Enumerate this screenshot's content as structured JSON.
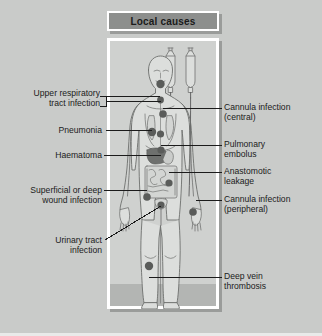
{
  "panel": {
    "title": "Local causes",
    "colors": {
      "page_background": "#c9cbc9",
      "panel_background": "#cfd1cf",
      "panel_border": "#ffffff",
      "titlebar_background": "#8d8f8d",
      "floor_band": "#b3b5b3",
      "marker_dot": "#5a5c5a",
      "haematoma_blob": "#4a4c4a",
      "leader_line": "#1b1b1b",
      "body_outline": "#6d6f6d",
      "text": "#1b1b1b"
    }
  },
  "illustration": {
    "subject": "human-body-outline",
    "elements": [
      {
        "name": "iv-bag-left",
        "label": "intravenous fluid bag"
      },
      {
        "name": "iv-bag-right",
        "label": "intravenous fluid bag"
      },
      {
        "name": "iv-tubing",
        "label": "intravenous tubing"
      },
      {
        "name": "head",
        "label": "head"
      },
      {
        "name": "torso",
        "label": "torso"
      },
      {
        "name": "lungs",
        "label": "lungs"
      },
      {
        "name": "liver",
        "label": "liver"
      },
      {
        "name": "intestines",
        "label": "intestines"
      },
      {
        "name": "bladder",
        "label": "bladder"
      },
      {
        "name": "legs",
        "label": "legs"
      },
      {
        "name": "arms",
        "label": "arms"
      }
    ]
  },
  "labels": {
    "left": [
      {
        "id": "upper-respiratory-tract-infection",
        "text": "Upper respiratory\ntract infection"
      },
      {
        "id": "pneumonia",
        "text": "Pneumonia"
      },
      {
        "id": "haematoma",
        "text": "Haematoma"
      },
      {
        "id": "superficial-or-deep-wound-infection",
        "text": "Superficial or deep\nwound infection"
      },
      {
        "id": "urinary-tract-infection",
        "text": "Urinary tract\ninfection"
      }
    ],
    "right": [
      {
        "id": "cannula-infection-central",
        "text": "Cannula infection\n(central)"
      },
      {
        "id": "pulmonary-embolus",
        "text": "Pulmonary\nembolus"
      },
      {
        "id": "anastomotic-leakage",
        "text": "Anastomotic\nleakage"
      },
      {
        "id": "cannula-infection-peripheral",
        "text": "Cannula infection\n(peripheral)"
      },
      {
        "id": "deep-vein-thrombosis",
        "text": "Deep vein\nthrombosis"
      }
    ]
  }
}
